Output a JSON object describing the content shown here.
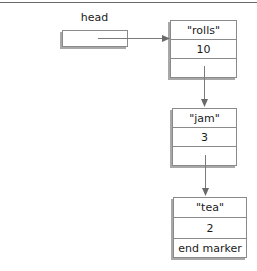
{
  "head": {
    "label": "head"
  },
  "nodes": [
    {
      "name": "\"rolls\"",
      "count": "10",
      "next": ""
    },
    {
      "name": "\"jam\"",
      "count": "3",
      "next": ""
    },
    {
      "name": "\"tea\"",
      "count": "2",
      "next": "end marker"
    }
  ],
  "colors": {
    "line": "#7a7a7a",
    "border": "#8a8a8a",
    "shadow": "#a8a8a8"
  }
}
